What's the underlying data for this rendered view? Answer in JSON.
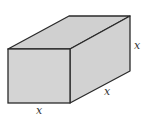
{
  "diagram": {
    "type": "rectangular-prism",
    "colors": {
      "fill": "#d4d4d4",
      "top": "#d0d0d0",
      "side": "#d2d2d2",
      "stroke": "#2a2a2a"
    },
    "labels": {
      "front_bottom": "x",
      "side_bottom": "x",
      "side_right": "x"
    }
  }
}
